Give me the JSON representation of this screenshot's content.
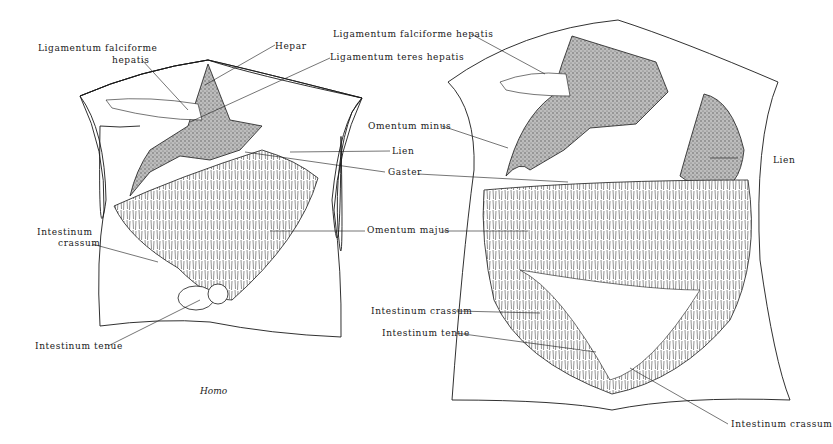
{
  "figure": {
    "type": "anatomical-illustration",
    "caption": "Homo",
    "left_panel": {
      "labels": {
        "lig_falciforme_1": "Ligamentum falciforme",
        "lig_falciforme_2": "hepatis",
        "hepar": "Hepar",
        "lig_teres": "Ligamentum teres hepatis",
        "lien": "Lien",
        "gaster": "Gaster",
        "int_crassum_1": "Intestinum",
        "int_crassum_2": "crassum",
        "omentum_majus": "Omentum majus",
        "int_tenue": "Intestinum tenue"
      }
    },
    "right_panel": {
      "labels": {
        "lig_falciforme": "Ligamentum falciforme hepatis",
        "omentum_minus": "Omentum minus",
        "lien": "Lien",
        "int_crassum_upper": "Intestinum crassum",
        "int_tenue": "Intestinum tenue",
        "int_crassum_lower": "Intestinum crassum"
      }
    },
    "colors": {
      "ink": "#1a1a1a",
      "background": "#ffffff",
      "stipple": "#777777"
    }
  }
}
